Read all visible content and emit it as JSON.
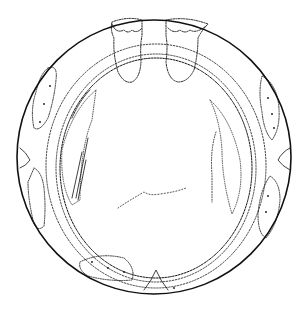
{
  "figure": {
    "type": "line-drawing",
    "background": "#ffffff",
    "ink": "#111111",
    "outer_circle": {
      "cx": 154,
      "cy": 157,
      "r": 137
    },
    "inner_ring": {
      "cx": 156,
      "cy": 168,
      "rx": 96,
      "ry": 110
    }
  }
}
